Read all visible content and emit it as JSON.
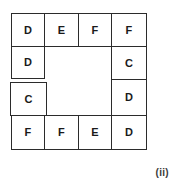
{
  "figure": {
    "label": "(ii)",
    "caption_position": "bottom-right",
    "background_color": "#ffffff",
    "line_color": "#2b2b2b",
    "text_color": "#1a1a1a"
  },
  "grid": {
    "rows": 4,
    "columns": 4,
    "center_empty": true,
    "description": "Four-by-four letter grid with a hollow two-by-two centre; letters occupy only the border cells.",
    "cells": {
      "row1": [
        {
          "id": "r1c1",
          "letter": "D"
        },
        {
          "id": "r1c2",
          "letter": "E"
        },
        {
          "id": "r1c3",
          "letter": "F"
        },
        {
          "id": "r1c4",
          "letter": "F"
        }
      ],
      "row2": [
        {
          "id": "r2c1",
          "letter": "D"
        },
        {
          "id": "r2c4",
          "letter": "C"
        }
      ],
      "row3": [
        {
          "id": "r3c1",
          "letter": "C"
        },
        {
          "id": "r3c4",
          "letter": "D"
        }
      ],
      "row4": [
        {
          "id": "r4c1",
          "letter": "F"
        },
        {
          "id": "r4c2",
          "letter": "F"
        },
        {
          "id": "r4c3",
          "letter": "E"
        },
        {
          "id": "r4c4",
          "letter": "D"
        }
      ]
    },
    "letters_clockwise_from_top_left": [
      "D",
      "E",
      "F",
      "F",
      "C",
      "D",
      "D",
      "E",
      "F",
      "F",
      "C",
      "D"
    ]
  }
}
